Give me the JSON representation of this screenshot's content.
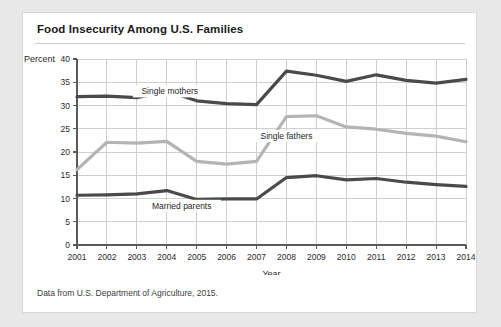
{
  "card": {
    "title": "Food Insecurity Among U.S. Families",
    "source_note": "Data from U.S. Department of Agriculture, 2015."
  },
  "chart_data": {
    "type": "line",
    "title": "Food Insecurity Among U.S. Families",
    "xlabel": "Year",
    "ylabel": "Percent",
    "categories": [
      "2001",
      "2002",
      "2003",
      "2004",
      "2005",
      "2006",
      "2007",
      "2008",
      "2009",
      "2010",
      "2011",
      "2012",
      "2013",
      "2014"
    ],
    "x": [
      2001,
      2002,
      2003,
      2004,
      2005,
      2006,
      2007,
      2008,
      2009,
      2010,
      2011,
      2012,
      2013,
      2014
    ],
    "xlim": [
      2001,
      2014
    ],
    "ylim": [
      0,
      40
    ],
    "yticks": [
      0,
      5,
      10,
      15,
      20,
      25,
      30,
      35,
      40
    ],
    "grid": true,
    "legend": "inline-labels",
    "series": [
      {
        "name": "Single mothers",
        "color": "#4a4a4a",
        "values": [
          31.9,
          32.0,
          31.7,
          33.1,
          31.0,
          30.4,
          30.2,
          37.4,
          36.5,
          35.2,
          36.6,
          35.4,
          34.8,
          35.6
        ],
        "label_x": 2004.1,
        "label_y": 32.6
      },
      {
        "name": "Single fathers",
        "color": "#b4b4b4",
        "values": [
          16.2,
          22.1,
          21.9,
          22.3,
          18.0,
          17.4,
          18.0,
          27.6,
          27.8,
          25.4,
          24.9,
          24.0,
          23.4,
          22.2
        ],
        "label_x": 2008.0,
        "label_y": 23.0
      },
      {
        "name": "Married parents",
        "color": "#4a4a4a",
        "values": [
          10.7,
          10.8,
          11.0,
          11.7,
          9.8,
          9.9,
          9.9,
          14.5,
          14.9,
          14.0,
          14.3,
          13.5,
          13.0,
          12.6
        ],
        "label_x": 2004.5,
        "label_y": 8.0
      }
    ]
  }
}
